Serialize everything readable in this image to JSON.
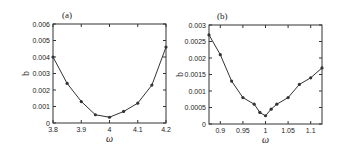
{
  "chart_data": [
    {
      "type": "line",
      "panel_label": "(a)",
      "title": "",
      "xlabel": "ω",
      "ylabel": "b",
      "xlim": [
        3.8,
        4.2
      ],
      "ylim": [
        0,
        0.006
      ],
      "xticks": [
        3.8,
        3.9,
        4.0,
        4.1,
        4.2
      ],
      "xtick_labels": [
        "3.8",
        "3.9",
        "4",
        "4.1",
        "4.2"
      ],
      "yticks": [
        0,
        0.001,
        0.002,
        0.003,
        0.004,
        0.005,
        0.006
      ],
      "ytick_labels": [
        "0",
        "0.001",
        "0.002",
        "0.003",
        "0.004",
        "0.005",
        "0.006"
      ],
      "grid": false,
      "series": [
        {
          "name": "b",
          "x": [
            3.8,
            3.85,
            3.9,
            3.95,
            4.0,
            4.05,
            4.1,
            4.15,
            4.2
          ],
          "values": [
            0.004,
            0.0024,
            0.0013,
            0.0005,
            0.00035,
            0.0007,
            0.0012,
            0.0023,
            0.0046
          ]
        }
      ]
    },
    {
      "type": "line",
      "panel_label": "(b)",
      "title": "",
      "xlabel": "ω",
      "ylabel": "b",
      "xlim": [
        0.875,
        1.125
      ],
      "ylim": [
        0,
        0.003
      ],
      "xticks": [
        0.9,
        0.95,
        1.0,
        1.05,
        1.1
      ],
      "xtick_labels": [
        "0.9",
        "0.95",
        "1",
        "1.05",
        "1.1"
      ],
      "yticks": [
        0,
        0.0005,
        0.001,
        0.0015,
        0.002,
        0.0025,
        0.003
      ],
      "ytick_labels": [
        "0",
        "0.0005",
        "0.001",
        "0.0015",
        "0.002",
        "0.0025",
        "0.003"
      ],
      "grid": false,
      "series": [
        {
          "name": "b",
          "x": [
            0.875,
            0.9,
            0.925,
            0.95,
            0.975,
            0.9875,
            1.0,
            1.0125,
            1.025,
            1.05,
            1.075,
            1.1,
            1.125
          ],
          "values": [
            0.0027,
            0.0021,
            0.0013,
            0.0008,
            0.0006,
            0.00035,
            0.00025,
            0.00045,
            0.0006,
            0.0008,
            0.0012,
            0.0014,
            0.0017
          ]
        }
      ]
    }
  ]
}
